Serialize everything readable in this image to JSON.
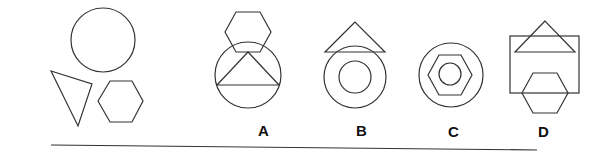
{
  "question": {
    "description": "Figure reasoning puzzle: given a circle, a triangle and a hexagon, choose which option combines them",
    "given_shapes": [
      "circle",
      "triangle",
      "hexagon"
    ]
  },
  "options": [
    {
      "label": "A",
      "shapes": [
        "hexagon",
        "circle",
        "triangle"
      ]
    },
    {
      "label": "B",
      "shapes": [
        "triangle",
        "circle",
        "circle"
      ]
    },
    {
      "label": "C",
      "shapes": [
        "circle",
        "hexagon",
        "circle"
      ]
    },
    {
      "label": "D",
      "shapes": [
        "rectangle",
        "triangle",
        "hexagon"
      ]
    }
  ],
  "colors": {
    "stroke": "#333333",
    "label": "#111111",
    "background": "#ffffff"
  }
}
